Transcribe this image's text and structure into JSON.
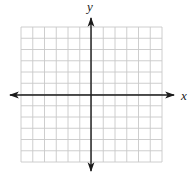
{
  "diagram": {
    "type": "coordinate-plane",
    "x_axis_label": "x",
    "y_axis_label": "y",
    "grid": {
      "columns": 12,
      "rows": 12,
      "columns_left_of_y_axis": 6,
      "columns_right_of_y_axis": 6,
      "rows_above_x_axis": 6,
      "rows_below_x_axis": 6,
      "has_tick_labels": false
    },
    "colors": {
      "grid_line": "#c8c8c8",
      "axis": "#1a1a1a",
      "background": "#ffffff"
    }
  }
}
